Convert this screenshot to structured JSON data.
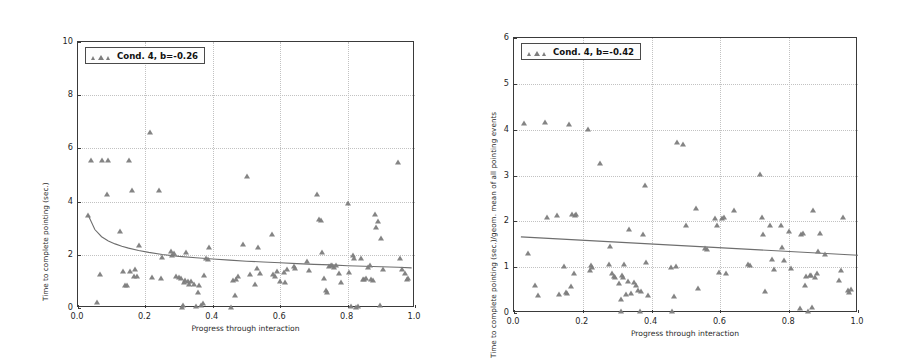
{
  "figure": {
    "panel_count": 2,
    "marker_color": "#7d7d7d",
    "line_color": "#6e6e6e",
    "grid_color": "#c2c2c2",
    "axis_color": "#3a3a3a"
  },
  "chart_data": [
    {
      "type": "scatter",
      "panel": "left",
      "title": "",
      "xlabel": "Progress through interaction",
      "ylabel": "Time to complete pointing (sec.)",
      "legend": {
        "label": "Cond. 4, b=-0.26",
        "position": "upper left",
        "marker": "triangle-up"
      },
      "xlim": [
        0.0,
        1.0
      ],
      "ylim": [
        0,
        10
      ],
      "xticks": [
        "0.0",
        "0.2",
        "0.4",
        "0.6",
        "0.8",
        "1.0"
      ],
      "xtick_values": [
        0.0,
        0.2,
        0.4,
        0.6,
        0.8,
        1.0
      ],
      "yticks": [
        "0",
        "2",
        "4",
        "6",
        "8",
        "10"
      ],
      "ytick_values": [
        0,
        2,
        4,
        6,
        8,
        10
      ],
      "grid": true,
      "grid_style": "dotted",
      "fit": {
        "kind": "power-decay",
        "coefficient_label": "b=-0.26",
        "points": [
          [
            0.03,
            3.5
          ],
          [
            0.05,
            2.95
          ],
          [
            0.07,
            2.68
          ],
          [
            0.09,
            2.52
          ],
          [
            0.11,
            2.41
          ],
          [
            0.13,
            2.32
          ],
          [
            0.15,
            2.25
          ],
          [
            0.18,
            2.16
          ],
          [
            0.21,
            2.09
          ],
          [
            0.25,
            2.01
          ],
          [
            0.3,
            1.94
          ],
          [
            0.35,
            1.89
          ],
          [
            0.4,
            1.84
          ],
          [
            0.45,
            1.8
          ],
          [
            0.5,
            1.76
          ],
          [
            0.55,
            1.73
          ],
          [
            0.6,
            1.7
          ],
          [
            0.65,
            1.67
          ],
          [
            0.7,
            1.64
          ],
          [
            0.75,
            1.62
          ],
          [
            0.8,
            1.59
          ],
          [
            0.85,
            1.57
          ],
          [
            0.9,
            1.55
          ],
          [
            0.95,
            1.53
          ],
          [
            0.99,
            1.51
          ]
        ]
      },
      "x": [
        0.03,
        0.04,
        0.055,
        0.065,
        0.07,
        0.085,
        0.09,
        0.125,
        0.135,
        0.14,
        0.145,
        0.15,
        0.155,
        0.16,
        0.165,
        0.17,
        0.175,
        0.18,
        0.215,
        0.22,
        0.24,
        0.245,
        0.25,
        0.275,
        0.28,
        0.285,
        0.29,
        0.3,
        0.305,
        0.31,
        0.312,
        0.315,
        0.318,
        0.32,
        0.325,
        0.33,
        0.335,
        0.345,
        0.35,
        0.355,
        0.36,
        0.365,
        0.37,
        0.375,
        0.38,
        0.385,
        0.39,
        0.455,
        0.46,
        0.465,
        0.47,
        0.475,
        0.49,
        0.5,
        0.51,
        0.525,
        0.53,
        0.535,
        0.54,
        0.575,
        0.58,
        0.585,
        0.59,
        0.6,
        0.61,
        0.615,
        0.62,
        0.64,
        0.645,
        0.68,
        0.685,
        0.71,
        0.715,
        0.72,
        0.725,
        0.73,
        0.735,
        0.74,
        0.745,
        0.75,
        0.755,
        0.76,
        0.765,
        0.775,
        0.78,
        0.8,
        0.805,
        0.81,
        0.815,
        0.82,
        0.825,
        0.83,
        0.84,
        0.845,
        0.85,
        0.855,
        0.86,
        0.865,
        0.87,
        0.875,
        0.88,
        0.885,
        0.89,
        0.895,
        0.9,
        0.905,
        0.95,
        0.955,
        0.96,
        0.97,
        0.975,
        0.98
      ],
      "y": [
        3.48,
        5.55,
        0.22,
        1.28,
        5.58,
        4.28,
        5.58,
        2.88,
        1.4,
        0.85,
        0.88,
        5.55,
        1.38,
        4.42,
        1.2,
        1.48,
        1.22,
        2.35,
        6.62,
        1.15,
        4.43,
        1.14,
        1.92,
        2.13,
        2.0,
        2.05,
        1.22,
        1.18,
        1.12,
        0.05,
        0.1,
        0.98,
        1.05,
        2.1,
        1.0,
        0.9,
        1.02,
        0.92,
        0.07,
        0.6,
        0.88,
        0.1,
        0.2,
        1.25,
        1.88,
        1.86,
        2.28,
        0.05,
        1.05,
        0.5,
        1.1,
        1.2,
        2.42,
        4.96,
        1.28,
        0.9,
        1.52,
        2.3,
        1.3,
        2.8,
        1.28,
        1.22,
        1.38,
        1.0,
        1.35,
        0.98,
        1.45,
        1.58,
        1.52,
        1.78,
        1.42,
        4.3,
        3.35,
        3.3,
        2.1,
        1.12,
        0.66,
        0.62,
        1.58,
        1.62,
        1.6,
        1.55,
        1.6,
        1.3,
        0.98,
        3.95,
        1.35,
        0.08,
        1.98,
        1.88,
        0.05,
        0.08,
        1.88,
        1.1,
        1.08,
        1.12,
        1.55,
        1.6,
        1.1,
        1.06,
        3.55,
        3.05,
        3.28,
        0.1,
        2.65,
        1.48,
        5.48,
        1.88,
        1.45,
        1.3,
        1.08,
        1.12
      ]
    },
    {
      "type": "scatter",
      "panel": "right",
      "title": "",
      "xlabel": "Progress through interaction",
      "ylabel": "Time to complete pointing (sec.)/geom. mean of all pointing events",
      "legend": {
        "label": "Cond. 4, b=-0.42",
        "position": "upper left",
        "marker": "triangle-up"
      },
      "xlim": [
        0.0,
        1.0
      ],
      "ylim": [
        0,
        6
      ],
      "xticks": [
        "0.0",
        "0.2",
        "0.4",
        "0.6",
        "0.8",
        "1.0"
      ],
      "xtick_values": [
        0.0,
        0.2,
        0.4,
        0.6,
        0.8,
        1.0
      ],
      "yticks": [
        "0",
        "1",
        "2",
        "3",
        "4",
        "5",
        "6"
      ],
      "ytick_values": [
        0,
        1,
        2,
        3,
        4,
        5,
        6
      ],
      "grid": true,
      "grid_style": "dotted",
      "fit": {
        "kind": "linear",
        "coefficient_label": "b=-0.42",
        "points": [
          [
            0.02,
            1.66
          ],
          [
            1.0,
            1.26
          ]
        ]
      },
      "x": [
        0.03,
        0.04,
        0.06,
        0.07,
        0.09,
        0.095,
        0.125,
        0.13,
        0.145,
        0.15,
        0.155,
        0.16,
        0.165,
        0.17,
        0.175,
        0.178,
        0.18,
        0.215,
        0.22,
        0.225,
        0.228,
        0.25,
        0.275,
        0.28,
        0.285,
        0.29,
        0.295,
        0.305,
        0.31,
        0.312,
        0.315,
        0.318,
        0.32,
        0.325,
        0.33,
        0.335,
        0.34,
        0.35,
        0.355,
        0.36,
        0.365,
        0.37,
        0.375,
        0.38,
        0.385,
        0.39,
        0.455,
        0.46,
        0.465,
        0.47,
        0.475,
        0.49,
        0.5,
        0.53,
        0.535,
        0.555,
        0.56,
        0.585,
        0.59,
        0.595,
        0.605,
        0.61,
        0.615,
        0.64,
        0.68,
        0.685,
        0.715,
        0.72,
        0.725,
        0.73,
        0.745,
        0.75,
        0.755,
        0.775,
        0.78,
        0.785,
        0.8,
        0.805,
        0.83,
        0.835,
        0.84,
        0.845,
        0.85,
        0.855,
        0.86,
        0.862,
        0.865,
        0.87,
        0.875,
        0.88,
        0.885,
        0.89,
        0.905,
        0.945,
        0.95,
        0.955,
        0.97,
        0.975,
        0.98
      ],
      "y": [
        4.14,
        1.32,
        0.62,
        0.4,
        4.16,
        2.1,
        2.14,
        0.42,
        1.02,
        0.46,
        0.44,
        4.13,
        0.6,
        2.16,
        0.88,
        2.14,
        2.15,
        4.01,
        0.94,
        1.05,
        1.0,
        3.28,
        1.07,
        1.47,
        0.88,
        0.8,
        0.78,
        0.65,
        0.3,
        0.05,
        0.82,
        0.78,
        1.06,
        0.42,
        0.7,
        1.84,
        0.44,
        0.68,
        0.62,
        0.5,
        0.05,
        0.48,
        1.72,
        2.8,
        1.12,
        0.4,
        1.0,
        0.05,
        0.38,
        1.02,
        3.74,
        3.68,
        1.93,
        2.3,
        0.54,
        1.42,
        1.4,
        2.08,
        1.93,
        0.9,
        2.08,
        2.1,
        0.88,
        2.25,
        1.08,
        1.05,
        3.04,
        2.1,
        1.73,
        0.48,
        1.92,
        1.18,
        0.95,
        1.92,
        1.44,
        1.16,
        1.78,
        0.98,
        0.12,
        1.73,
        1.75,
        0.62,
        0.8,
        0.05,
        0.84,
        0.82,
        0.14,
        2.25,
        0.78,
        0.88,
        1.36,
        1.74,
        1.28,
        0.72,
        0.94,
        2.1,
        0.5,
        0.46,
        0.52
      ]
    }
  ]
}
